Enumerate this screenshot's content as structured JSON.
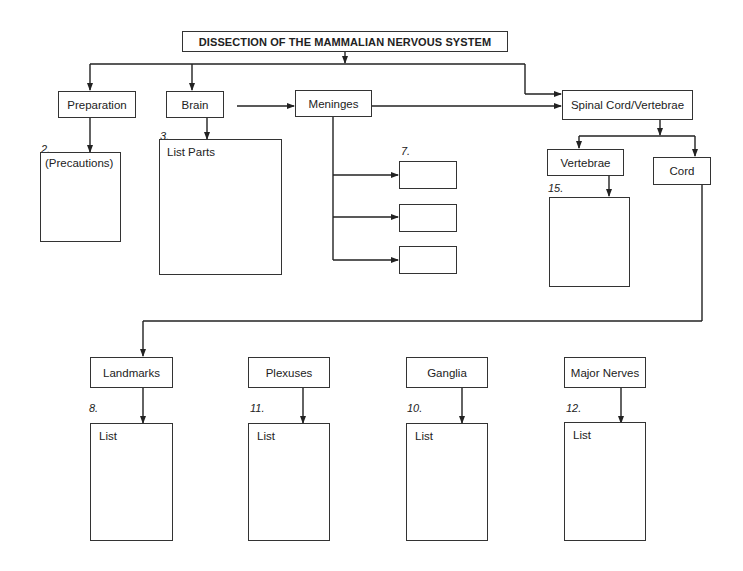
{
  "title": "DISSECTION OF THE MAMMALIAN NERVOUS SYSTEM",
  "top_level": {
    "preparation": "Preparation",
    "brain": "Brain",
    "meninges": "Meninges",
    "spinal": "Spinal Cord/Vertebrae"
  },
  "preparation_box": {
    "number": "2.",
    "label": "(Precautions)"
  },
  "brain_box": {
    "number": "3.",
    "label": "List Parts"
  },
  "meninges_boxes": {
    "number": "7.",
    "items": [
      "",
      "",
      ""
    ]
  },
  "spinal_children": {
    "vertebrae": "Vertebrae",
    "cord": "Cord",
    "vertebrae_box_number": "15."
  },
  "cord_children": [
    {
      "label": "Landmarks",
      "number": "8.",
      "list_label": "List"
    },
    {
      "label": "Plexuses",
      "number": "11.",
      "list_label": "List"
    },
    {
      "label": "Ganglia",
      "number": "10.",
      "list_label": "List"
    },
    {
      "label": "Major Nerves",
      "number": "12.",
      "list_label": "List"
    }
  ]
}
